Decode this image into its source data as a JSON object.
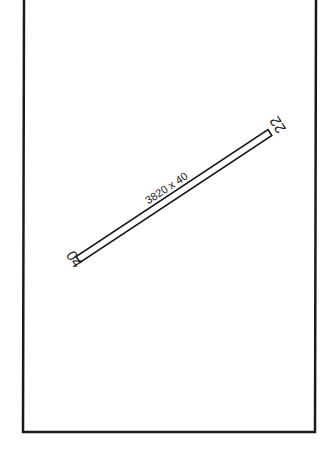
{
  "diagram": {
    "type": "airport-runway-diagram",
    "runway": {
      "dimensions_label": "3820 x 40",
      "end_southwest": "04",
      "end_northeast": "22"
    },
    "colors": {
      "line": "#1a1a1a",
      "background": "#ffffff"
    }
  }
}
